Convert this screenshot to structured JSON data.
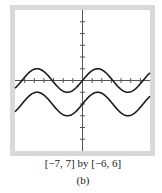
{
  "chart_data": {
    "type": "line",
    "title": "",
    "xlabel": "",
    "ylabel": "",
    "xlim": [
      -7,
      7
    ],
    "ylim": [
      -6,
      6
    ],
    "x_tick_step": 1,
    "y_tick_step": 1,
    "tick_labels": false,
    "grid": false,
    "legend": "none",
    "series": [
      {
        "name": "y = sin(x)",
        "function": "sin(x)",
        "amplitude": 1,
        "vertical_shift": 0,
        "color": "#1a1a1a"
      },
      {
        "name": "y = sin(x) - 2",
        "function": "sin(x) - 2",
        "amplitude": 1,
        "vertical_shift": -2,
        "color": "#1a1a1a"
      }
    ],
    "window_caption": "[−7, 7] by [−6, 6]",
    "panel_label": "(b)",
    "frame_color": "#d9d9d9",
    "axis_color": "#555555"
  }
}
